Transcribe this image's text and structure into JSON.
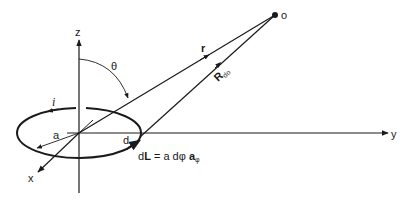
{
  "diagram": {
    "type": "current-loop-geometry",
    "colors": {
      "stroke": "#1a1a1a",
      "background": "#ffffff"
    },
    "axes": {
      "z_label": "z",
      "y_label": "y",
      "x_label": "x"
    },
    "loop": {
      "current_label": "i",
      "radius_label": "a",
      "element_label": "d",
      "dL_text": "dL = a dφ a",
      "dL_prefix": "d",
      "dL_bold": "L",
      "dL_middle": " = a dφ ",
      "dL_unit_bold": "a",
      "dL_unit_sub": "φ"
    },
    "angle_label": "θ",
    "vectors": {
      "r_label": "r",
      "R_label": "R",
      "R_subscript": "do"
    },
    "point_label": "o"
  }
}
